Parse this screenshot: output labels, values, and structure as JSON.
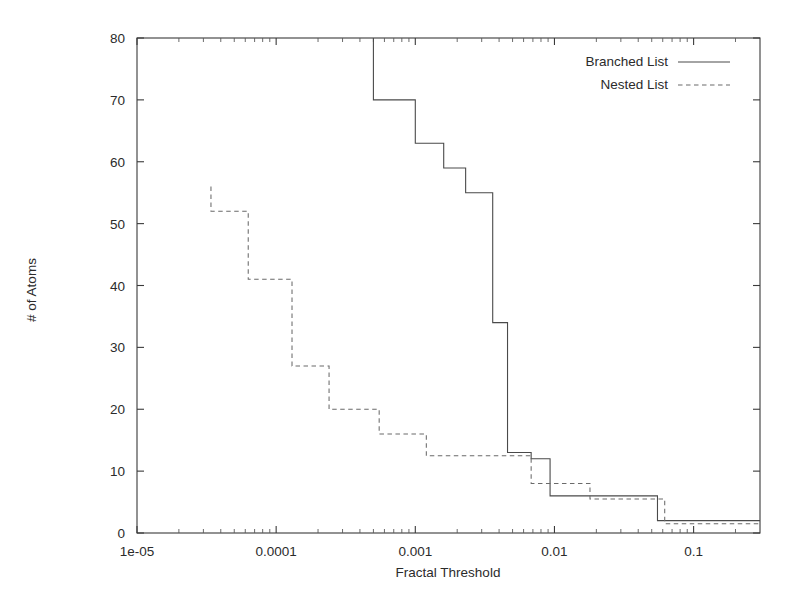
{
  "chart_data": {
    "type": "line",
    "subtype": "step-decreasing",
    "title": "",
    "xlabel": "Fractal Threshold",
    "ylabel": "# of Atoms",
    "xscale": "log",
    "yscale": "linear",
    "xlim": [
      1e-05,
      0.3
    ],
    "ylim": [
      0,
      80
    ],
    "grid": false,
    "legend_position": "top-right",
    "x_tick_labels": [
      "1e-05",
      "0.0001",
      "0.001",
      "0.01",
      "0.1"
    ],
    "x_tick_values": [
      1e-05,
      0.0001,
      0.001,
      0.01,
      0.1
    ],
    "y_tick_labels": [
      "0",
      "10",
      "20",
      "30",
      "40",
      "50",
      "60",
      "70",
      "80"
    ],
    "y_tick_values": [
      0,
      10,
      20,
      30,
      40,
      50,
      60,
      70,
      80
    ],
    "series": [
      {
        "name": "Branched List",
        "style": "solid",
        "color": "#4a4a4a",
        "points": [
          [
            0.0005,
            80
          ],
          [
            0.0005,
            70
          ],
          [
            0.001,
            70
          ],
          [
            0.001,
            63
          ],
          [
            0.0016,
            63
          ],
          [
            0.0016,
            59
          ],
          [
            0.0023,
            59
          ],
          [
            0.0023,
            55
          ],
          [
            0.0036,
            55
          ],
          [
            0.0036,
            34
          ],
          [
            0.0046,
            34
          ],
          [
            0.0046,
            13
          ],
          [
            0.0068,
            13
          ],
          [
            0.0068,
            12
          ],
          [
            0.0093,
            12
          ],
          [
            0.0093,
            6
          ],
          [
            0.055,
            6
          ],
          [
            0.055,
            2
          ],
          [
            0.3,
            2
          ]
        ]
      },
      {
        "name": "Nested List",
        "style": "dashed",
        "color": "#6a6a6a",
        "points": [
          [
            3.4e-05,
            56
          ],
          [
            3.4e-05,
            52
          ],
          [
            6.3e-05,
            52
          ],
          [
            6.3e-05,
            41
          ],
          [
            0.00013,
            41
          ],
          [
            0.00013,
            27
          ],
          [
            0.00024,
            27
          ],
          [
            0.00024,
            20
          ],
          [
            0.00055,
            20
          ],
          [
            0.00055,
            16
          ],
          [
            0.0012,
            16
          ],
          [
            0.0012,
            12.5
          ],
          [
            0.0068,
            12.5
          ],
          [
            0.0068,
            8
          ],
          [
            0.018,
            8
          ],
          [
            0.018,
            5.5
          ],
          [
            0.062,
            5.5
          ],
          [
            0.062,
            1.5
          ],
          [
            0.3,
            1.5
          ]
        ]
      }
    ],
    "legend": [
      {
        "label": "Branched List",
        "style": "solid"
      },
      {
        "label": "Nested List",
        "style": "dashed"
      }
    ]
  },
  "axis": {
    "x_title": "Fractal Threshold",
    "y_title": "# of Atoms"
  },
  "legend": {
    "entries": [
      {
        "label": "Branched List"
      },
      {
        "label": "Nested List"
      }
    ]
  }
}
